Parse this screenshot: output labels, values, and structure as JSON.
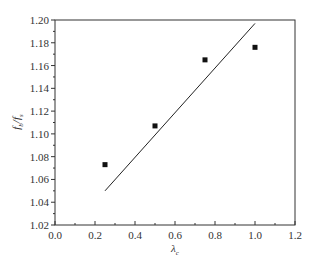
{
  "chart_data": {
    "type": "scatter",
    "title": "",
    "xlabel": "λ_c",
    "ylabel": "f_b/f_s",
    "xlim": [
      0.0,
      1.2
    ],
    "ylim": [
      1.02,
      1.2
    ],
    "grid": false,
    "legend": null,
    "x_ticks": [
      "0.0",
      "0.2",
      "0.4",
      "0.6",
      "0.8",
      "1.0",
      "1.2"
    ],
    "y_ticks": [
      "1.02",
      "1.04",
      "1.06",
      "1.08",
      "1.10",
      "1.12",
      "1.14",
      "1.16",
      "1.18",
      "1.20"
    ],
    "series": [
      {
        "name": "measured",
        "type": "scatter",
        "marker": "square",
        "x": [
          0.25,
          0.5,
          0.75,
          1.0
        ],
        "y": [
          1.073,
          1.107,
          1.165,
          1.176
        ]
      },
      {
        "name": "fit",
        "type": "line",
        "x": [
          0.25,
          1.0
        ],
        "y": [
          1.05,
          1.197
        ]
      }
    ]
  },
  "labels": {
    "xlabel_main": "λ",
    "xlabel_sub": "c",
    "ylabel_f1": "f",
    "ylabel_sub1": "b",
    "ylabel_slash": "/f",
    "ylabel_sub2": "s"
  }
}
